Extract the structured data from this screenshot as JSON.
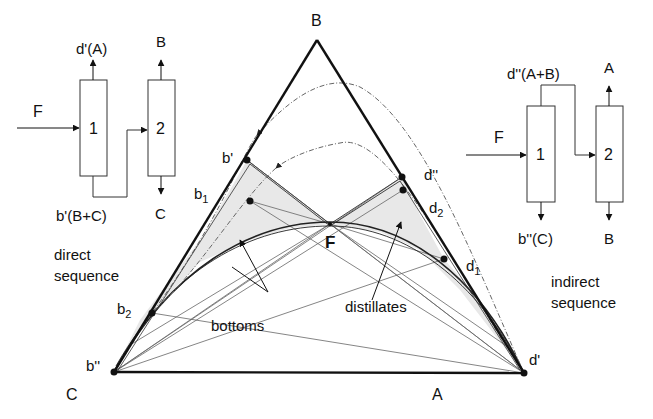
{
  "direct": {
    "feed_label": "F",
    "column1_label": "1",
    "column2_label": "2",
    "col1_top_product": "d'(A)",
    "col1_bottom_product": "b'(B+C)",
    "col2_top_product": "B",
    "col2_bottom_product": "C",
    "title_line1": "direct",
    "title_line2": "sequence"
  },
  "indirect": {
    "feed_label": "F",
    "column1_label": "1",
    "column2_label": "2",
    "col1_top_product": "d''(A+B)",
    "col1_bottom_product": "b''(C)",
    "col2_top_product": "A",
    "col2_bottom_product": "B",
    "title_line1": "indirect",
    "title_line2": "sequence"
  },
  "triangle": {
    "vertex_top": "B",
    "vertex_left": "C",
    "vertex_right": "A",
    "feed_point": "F",
    "points": {
      "b_prime": "b'",
      "b1": "b",
      "b1_sub": "1",
      "b2": "b",
      "b2_sub": "2",
      "b_double_prime": "b''",
      "d_double_prime": "d''",
      "d2": "d",
      "d2_sub": "2",
      "d1": "d",
      "d1_sub": "1",
      "d_prime": "d'"
    },
    "annotations": {
      "bottoms": "bottoms",
      "distillates": "distillates"
    }
  },
  "colors": {
    "line": "#111111",
    "thin_line": "#555555",
    "shade": "#e6e6e6",
    "dash": "#666666"
  }
}
